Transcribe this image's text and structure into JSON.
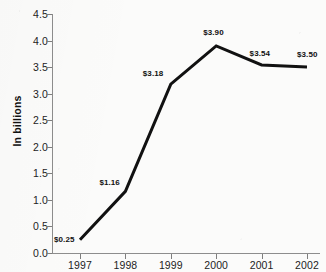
{
  "chart_data": {
    "type": "line",
    "title": "",
    "xlabel": "",
    "ylabel": "In billions",
    "categories": [
      "1997",
      "1998",
      "1999",
      "2000",
      "2001",
      "2002"
    ],
    "values": [
      0.25,
      1.16,
      3.18,
      3.9,
      3.54,
      3.5
    ],
    "point_labels": [
      "$0.25",
      "$1.16",
      "$3.18",
      "$3.90",
      "$3.54",
      "$3.50"
    ],
    "ylim": [
      0.0,
      4.5
    ],
    "ytick_labels": [
      "0.0",
      "0.5",
      "1.0",
      "1.5",
      "2.0",
      "2.5",
      "3.0",
      "3.5",
      "4.0",
      "4.5"
    ],
    "ytick_values": [
      0.0,
      0.5,
      1.0,
      1.5,
      2.0,
      2.5,
      3.0,
      3.5,
      4.0,
      4.5
    ],
    "grid": false,
    "legend": false,
    "series": [
      {
        "name": "",
        "values": [
          0.25,
          1.16,
          3.18,
          3.9,
          3.54,
          3.5
        ],
        "color": "#111111",
        "line_width": 3
      }
    ],
    "axis_color": "#8d8d8d",
    "background_color": "#fbfbfa",
    "text_color": "#1d1d1d"
  }
}
